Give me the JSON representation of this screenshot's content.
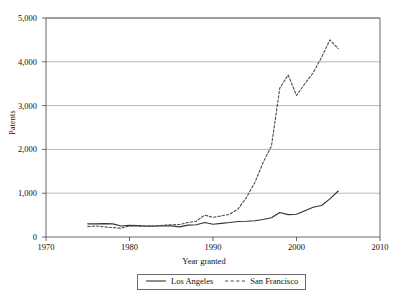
{
  "chart_data": {
    "type": "line",
    "title": "",
    "xlabel": "Year granted",
    "ylabel": "Patents",
    "xlim": [
      1970,
      2010
    ],
    "ylim": [
      0,
      5000
    ],
    "xticks": [
      1970,
      1980,
      1990,
      2000,
      2010
    ],
    "yticks": [
      0,
      1000,
      2000,
      3000,
      4000,
      5000
    ],
    "ytick_labels": [
      "0",
      "1,000",
      "2,000",
      "3,000",
      "4,000",
      "5,000"
    ],
    "xtick_labels": [
      "1970",
      "1980",
      "1990",
      "2000",
      "2010"
    ],
    "grid": "horizontal",
    "legend_position": "bottom-center",
    "x": [
      1975,
      1976,
      1977,
      1978,
      1979,
      1980,
      1981,
      1982,
      1983,
      1984,
      1985,
      1986,
      1987,
      1988,
      1989,
      1990,
      1991,
      1992,
      1993,
      1994,
      1995,
      1996,
      1997,
      1998,
      1999,
      2000,
      2001,
      2002,
      2003,
      2004,
      2005
    ],
    "series": [
      {
        "name": "Los Angeles",
        "style": "solid",
        "color": "#333333",
        "values": [
          300,
          300,
          305,
          300,
          250,
          265,
          260,
          250,
          250,
          255,
          255,
          230,
          270,
          280,
          330,
          290,
          310,
          330,
          355,
          360,
          370,
          400,
          440,
          560,
          510,
          520,
          600,
          680,
          720,
          870,
          1050
        ]
      },
      {
        "name": "San Francisco",
        "style": "dashed",
        "color": "#4d4d4d",
        "values": [
          240,
          250,
          230,
          215,
          200,
          255,
          250,
          245,
          250,
          270,
          280,
          285,
          330,
          360,
          500,
          450,
          480,
          520,
          640,
          900,
          1240,
          1700,
          2080,
          3400,
          3700,
          3230,
          3500,
          3750,
          4100,
          4500,
          4300
        ]
      }
    ]
  },
  "legend": {
    "items": [
      {
        "label": "Los Angeles",
        "style": "solid"
      },
      {
        "label": "San Francisco",
        "style": "dashed"
      }
    ]
  }
}
